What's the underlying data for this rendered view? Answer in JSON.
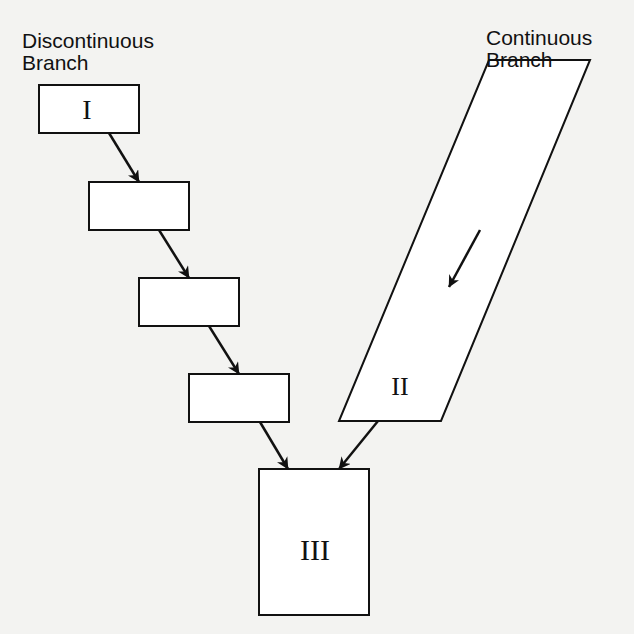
{
  "diagram": {
    "labels": {
      "discontinuous_line1": "Discontinuous",
      "discontinuous_line2": "Branch",
      "continuous_line1": "Continuous",
      "continuous_line2": "Branch"
    },
    "nodes": [
      {
        "id": "box-1",
        "label": "I"
      },
      {
        "id": "box-2",
        "label": ""
      },
      {
        "id": "box-3",
        "label": ""
      },
      {
        "id": "box-4",
        "label": ""
      },
      {
        "id": "continuous-parallelogram",
        "label": "II"
      },
      {
        "id": "box-final",
        "label": "III"
      }
    ],
    "edges": [
      {
        "from": "box-1",
        "to": "box-2"
      },
      {
        "from": "box-2",
        "to": "box-3"
      },
      {
        "from": "box-3",
        "to": "box-4"
      },
      {
        "from": "box-4",
        "to": "box-final"
      },
      {
        "from": "continuous-parallelogram",
        "to": "box-final"
      }
    ],
    "colors": {
      "stroke": "#111111",
      "background": "#f3f3f1",
      "fill": "#ffffff"
    }
  }
}
